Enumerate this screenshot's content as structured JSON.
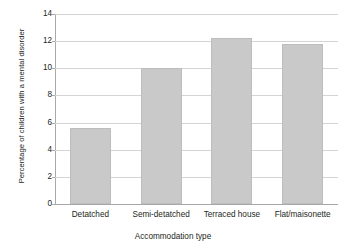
{
  "chart_data": {
    "type": "bar",
    "title": "",
    "subtitle": "",
    "xlabel": "Accommodation type",
    "ylabel": "Percentage of children with a mental disorder",
    "categories": [
      "Detatched",
      "Semi-detatched",
      "Terraced house",
      "Flat/maisonette"
    ],
    "values": [
      5.6,
      10.0,
      12.2,
      11.8
    ],
    "ylim": [
      0,
      14
    ],
    "ytick_labels": [
      "0",
      "2",
      "4",
      "6",
      "8",
      "10",
      "12",
      "14"
    ],
    "ytick_values": [
      0,
      2,
      4,
      6,
      8,
      10,
      12,
      14
    ],
    "grid": "horizontal",
    "legend": "none",
    "bar_color": "#c9c9c9",
    "bar_border_color": "#bdbdbd",
    "gridline_color": "#d4d4d4",
    "axis_color": "#a9a9a9",
    "background_color": "#ffffff",
    "text_color": "#231f20"
  }
}
